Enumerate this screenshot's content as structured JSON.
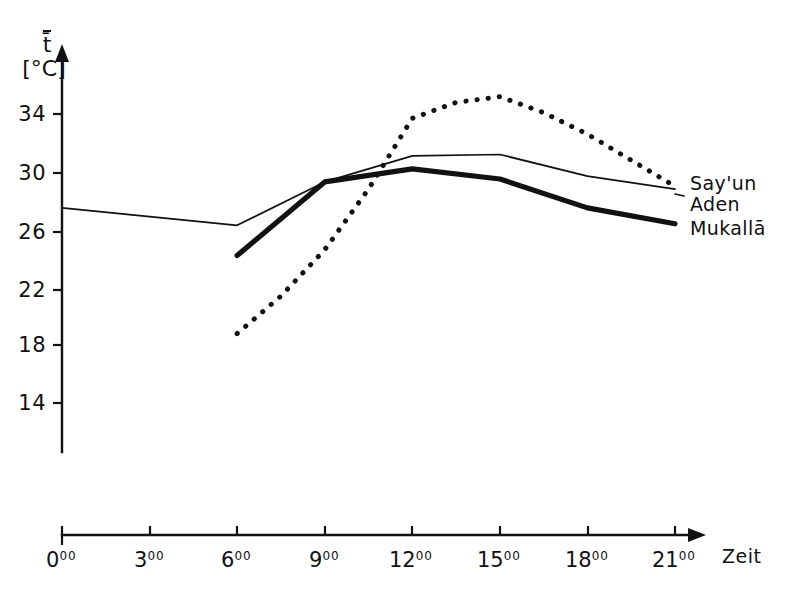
{
  "chart_data": {
    "type": "line",
    "title": "",
    "subtitle": "",
    "xlabel": "Zeit",
    "ylabel": "t̄",
    "yunit": "[°C]",
    "xtick_labels": [
      "0",
      "3",
      "6",
      "9",
      "12",
      "15",
      "18",
      "21"
    ],
    "xtick_superscript": "00",
    "xtick_values": [
      0,
      3,
      6,
      9,
      12,
      15,
      18,
      21
    ],
    "ytick_labels": [
      "34",
      "30",
      "26",
      "22",
      "18",
      "14"
    ],
    "ytick_values": [
      34,
      30,
      26,
      22,
      18,
      14
    ],
    "xlim": [
      0,
      21
    ],
    "ylim": [
      12,
      36
    ],
    "grid": false,
    "legend_position": "right",
    "series": [
      {
        "name": "Say'un",
        "style": "dotted",
        "x": [
          6,
          7.5,
          9,
          10.5,
          12,
          13.5,
          15,
          16.5,
          18,
          19.5,
          21
        ],
        "values": [
          18.8,
          21.4,
          24.6,
          28.8,
          33.7,
          34.8,
          35.2,
          34.1,
          32.6,
          30.8,
          29.0
        ]
      },
      {
        "name": "Aden",
        "style": "thin-line",
        "x": [
          0,
          3,
          6,
          9,
          12,
          15,
          18,
          21
        ],
        "values": [
          27.5,
          26.9,
          26.3,
          29.3,
          31.1,
          31.2,
          29.7,
          28.8
        ]
      },
      {
        "name": "Mukallā",
        "style": "thick-line",
        "x": [
          6,
          9,
          12,
          15,
          18,
          21
        ],
        "values": [
          24.2,
          29.3,
          30.2,
          29.5,
          27.5,
          26.4
        ]
      }
    ],
    "legend_entries": [
      {
        "label": "Say'un",
        "style": "dotted"
      },
      {
        "label": "Aden",
        "style": "thin-line"
      },
      {
        "label": "Mukallā",
        "style": "thick-line"
      }
    ]
  }
}
